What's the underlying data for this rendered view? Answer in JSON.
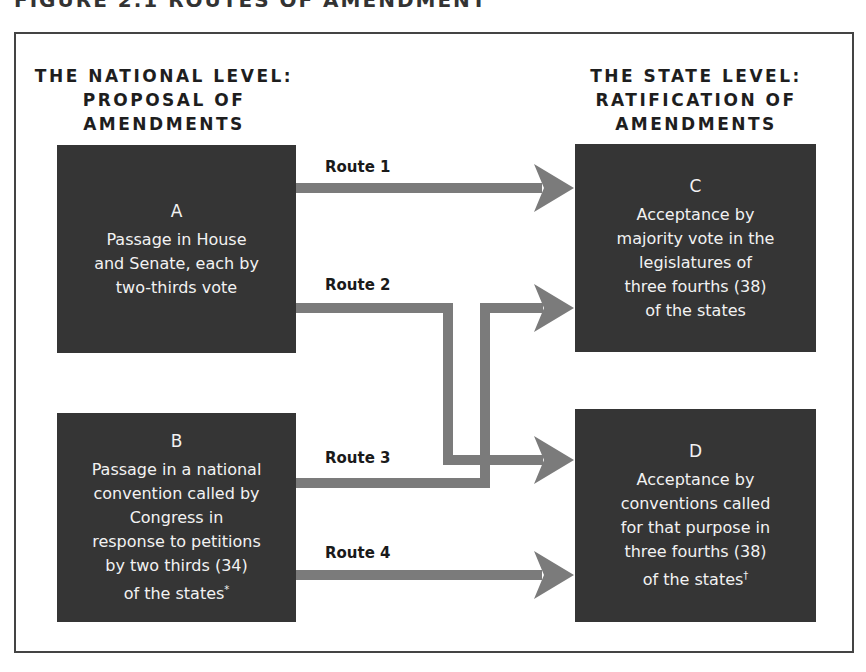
{
  "figure": {
    "title": "FIGURE 2.1 ROUTES OF AMENDMENT"
  },
  "headers": {
    "national": [
      "THE NATIONAL LEVEL:",
      "PROPOSAL OF",
      "AMENDMENTS"
    ],
    "state": [
      "THE STATE LEVEL:",
      "RATIFICATION OF",
      "AMENDMENTS"
    ]
  },
  "boxes": {
    "A": {
      "letter": "A",
      "lines": [
        "Passage in House",
        "and Senate, each by",
        "two-thirds vote"
      ]
    },
    "B": {
      "letter": "B",
      "lines": [
        "Passage in a national",
        "convention called by",
        "Congress in",
        "response to petitions",
        "by two thirds (34)",
        "of the states"
      ],
      "footnote_mark": "*"
    },
    "C": {
      "letter": "C",
      "lines": [
        "Acceptance by",
        "majority vote in the",
        "legislatures of",
        "three fourths (38)",
        "of the states"
      ]
    },
    "D": {
      "letter": "D",
      "lines": [
        "Acceptance by",
        "conventions called",
        "for that purpose in",
        "three fourths (38)",
        "of the states"
      ],
      "footnote_mark": "†"
    }
  },
  "routes": [
    {
      "label": "Route 1",
      "from": "A",
      "to": "C"
    },
    {
      "label": "Route 2",
      "from": "A",
      "to": "D"
    },
    {
      "label": "Route 3",
      "from": "B",
      "to": "C"
    },
    {
      "label": "Route 4",
      "from": "B",
      "to": "D"
    }
  ],
  "colors": {
    "box_fill": "#353535",
    "box_text": "#f2f2f2",
    "arrow": "#7b7b7b",
    "frame": "#444444"
  }
}
